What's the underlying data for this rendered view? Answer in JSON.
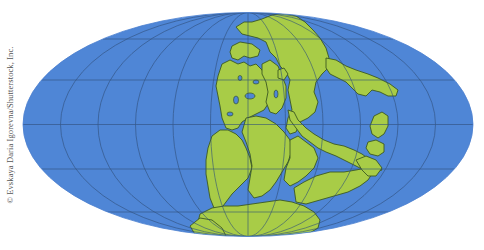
{
  "credit": "© Evskaya Daria Igorevna/Shutterstock, Inc.",
  "map": {
    "projection": "mollweide",
    "subject": "Pangaea supercontinent",
    "center": [
      248,
      124
    ],
    "rx": 225,
    "ry": 112,
    "meridian_spacing_deg": 30,
    "parallel_spacing_deg": 30,
    "colors": {
      "ocean": "#4f86d6",
      "land": "#a8cc48",
      "coastline": "#3d5a22",
      "grid": "#2f4f7a",
      "background": "#ffffff"
    }
  }
}
